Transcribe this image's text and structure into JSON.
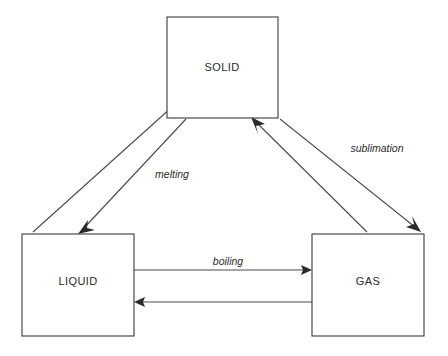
{
  "diagram": {
    "canvas": {
      "width": 448,
      "height": 356,
      "background": "#ffffff"
    },
    "line_color": "#4a4a4a",
    "box_stroke_color": "#3a3a3a",
    "text_color": "#2b2b2b",
    "nodes": [
      {
        "id": "solid",
        "label": "SOLID",
        "x": 167,
        "y": 17,
        "width": 111,
        "height": 101,
        "label_x": 222,
        "label_y": 68
      },
      {
        "id": "liquid",
        "label": "LIQUID",
        "x": 22,
        "y": 234,
        "width": 112,
        "height": 102,
        "label_x": 78,
        "label_y": 282
      },
      {
        "id": "gas",
        "label": "GAS",
        "x": 312,
        "y": 234,
        "width": 112,
        "height": 102,
        "label_x": 368,
        "label_y": 282
      }
    ],
    "edges": [
      {
        "id": "liquid-to-solid",
        "from": "liquid",
        "to": "solid",
        "label": "",
        "x1": 33,
        "y1": 232,
        "x2": 168,
        "y2": 104
      },
      {
        "id": "solid-to-liquid",
        "from": "solid",
        "to": "liquid",
        "label": "melting",
        "x1": 186,
        "y1": 119,
        "x2": 79,
        "y2": 232,
        "label_x": 172,
        "label_y": 175
      },
      {
        "id": "solid-to-gas",
        "from": "solid",
        "to": "gas",
        "label": "sublimation",
        "x1": 280,
        "y1": 119,
        "x2": 420,
        "y2": 231,
        "label_x": 377,
        "label_y": 149
      },
      {
        "id": "gas-to-solid",
        "from": "gas",
        "to": "solid",
        "label": "",
        "x1": 367,
        "y1": 232,
        "x2": 252,
        "y2": 119
      },
      {
        "id": "liquid-to-gas",
        "from": "liquid",
        "to": "gas",
        "label": "boiling",
        "x1": 134,
        "y1": 270,
        "x2": 311,
        "y2": 270,
        "label_x": 228,
        "label_y": 262
      },
      {
        "id": "gas-to-liquid",
        "from": "gas",
        "to": "liquid",
        "label": "",
        "x1": 312,
        "y1": 302,
        "x2": 136,
        "y2": 302
      }
    ]
  }
}
